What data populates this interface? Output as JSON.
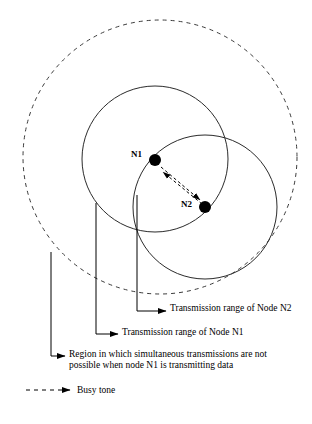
{
  "figure": {
    "nodes": [
      {
        "id": "n1",
        "label": "N1",
        "cx": 155,
        "cy": 160,
        "r": 6
      },
      {
        "id": "n2",
        "label": "N2",
        "cx": 205,
        "cy": 207,
        "r": 6
      }
    ],
    "circles": [
      {
        "id": "busy-tone-region",
        "style": "dashed",
        "cx": 160,
        "cy": 157,
        "r": 137
      },
      {
        "id": "n1-transmission-range",
        "style": "solid",
        "cx": 155,
        "cy": 159,
        "r": 73
      },
      {
        "id": "n2-transmission-range",
        "style": "solid",
        "cx": 205,
        "cy": 207,
        "r": 72
      }
    ],
    "callouts": [
      {
        "id": "n2-range",
        "text": "Transmission range of Node N2"
      },
      {
        "id": "n1-range",
        "text": "Transmission range of Node N1"
      },
      {
        "id": "region",
        "text": "Region in which simultaneous transmissions are not\npossible when node N1 is transmitting data"
      }
    ],
    "legend": [
      {
        "id": "busy-tone",
        "label": "Busy tone",
        "style": "dashed-arrow"
      }
    ],
    "colors": {
      "stroke": "#000000",
      "dashed_stroke": "#333333",
      "background": "#ffffff",
      "node_fill": "#000000"
    }
  }
}
